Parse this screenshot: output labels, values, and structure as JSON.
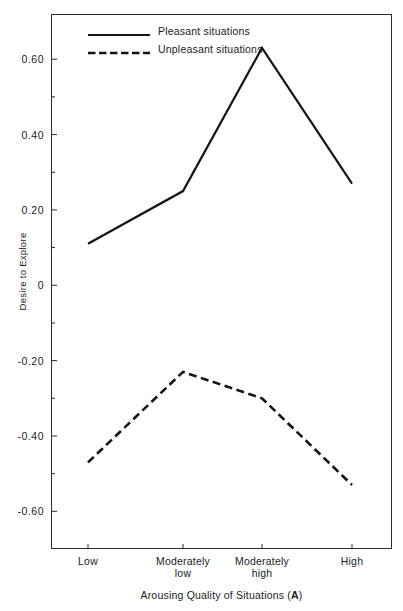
{
  "chart_data": {
    "type": "line",
    "title": "",
    "xlabel": "Arousing Quality of Situations (A)",
    "xlabel_plain": "Arousing Quality of Situations",
    "xlabel_bold_suffix": "A",
    "ylabel": "Desire to Explore",
    "categories": [
      "Low",
      "Moderately low",
      "Moderately high",
      "High"
    ],
    "category_lines": [
      [
        "Low",
        ""
      ],
      [
        "Moderately",
        "low"
      ],
      [
        "Moderately",
        "high"
      ],
      [
        "High",
        ""
      ]
    ],
    "ylim": [
      -0.7,
      0.72
    ],
    "yticks": [
      0.6,
      0.4,
      0.2,
      0,
      -0.2,
      -0.4,
      -0.6
    ],
    "ytick_labels": [
      "0.60",
      "0.40",
      "0.20",
      "0",
      "-0.20",
      "-0.40",
      "-0.60"
    ],
    "yminor_ticks": [
      0.5,
      0.3,
      0.1,
      -0.1,
      -0.3,
      -0.5
    ],
    "grid": false,
    "legend_position": "top-left-inside",
    "series": [
      {
        "name": "Pleasant situations",
        "style": "solid",
        "color": "#141414",
        "values": [
          0.11,
          0.25,
          0.63,
          0.27
        ]
      },
      {
        "name": "Unpleasant situations",
        "style": "dashed",
        "color": "#141414",
        "values": [
          -0.47,
          -0.23,
          -0.3,
          -0.53
        ]
      }
    ]
  },
  "legend": {
    "items": [
      {
        "label": "Pleasant situations",
        "style": "solid"
      },
      {
        "label": "Unpleasant situations",
        "style": "dashed"
      }
    ]
  },
  "axes": {
    "y_title": "Desire to Explore",
    "x_title_prefix": "Arousing Quality of Situations (",
    "x_title_bold": "A",
    "x_title_suffix": ")"
  }
}
